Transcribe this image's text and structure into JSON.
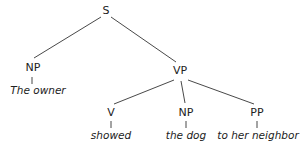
{
  "diagram": {
    "type": "syntax-tree",
    "nodes": {
      "s": "S",
      "np_subject": "NP",
      "vp": "VP",
      "v": "V",
      "np_object": "NP",
      "pp": "PP"
    },
    "leaves": {
      "subject": "The owner",
      "verb": "showed",
      "object": "the dog",
      "prep_phrase": "to her neighbor"
    },
    "edges": [
      [
        "S",
        "NP"
      ],
      [
        "S",
        "VP"
      ],
      [
        "NP",
        "The owner"
      ],
      [
        "VP",
        "V"
      ],
      [
        "VP",
        "NP"
      ],
      [
        "VP",
        "PP"
      ],
      [
        "V",
        "showed"
      ],
      [
        "NP",
        "the dog"
      ],
      [
        "PP",
        "to her neighbor"
      ]
    ],
    "line_color": "#333333"
  }
}
